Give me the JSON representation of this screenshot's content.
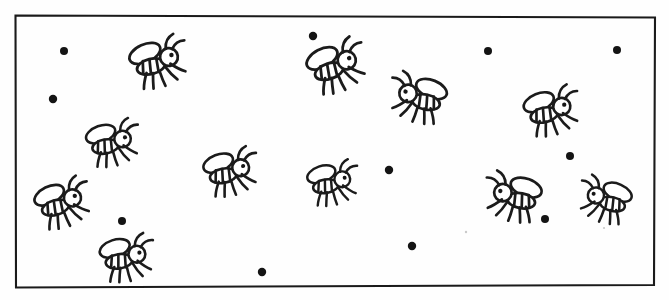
{
  "image": {
    "title": "Flies and dots inside a rectangular frame",
    "kind": "line-drawing-worksheet",
    "width": 669,
    "height": 300,
    "background_color": "#ffffff",
    "ink_color": "#1b1b1b"
  },
  "frame": {
    "name": "rectangular-border",
    "stroke_color": "#1a1a1a",
    "stroke_width": 2.1,
    "corners": {
      "top_left": [
        15,
        15
      ],
      "top_right": [
        655,
        17
      ],
      "bottom_right": [
        654,
        285
      ],
      "bottom_left": [
        16,
        287
      ]
    }
  },
  "counts": {
    "flies": 14,
    "dots": 13,
    "total_objects": 27
  },
  "flies": [
    {
      "id": "fly-1",
      "x": 160,
      "y": 62,
      "facing": "right",
      "scale": 1.06,
      "rotation": -8
    },
    {
      "id": "fly-2",
      "x": 114,
      "y": 143,
      "facing": "right",
      "scale": 0.98,
      "rotation": -4
    },
    {
      "id": "fly-3",
      "x": 64,
      "y": 203,
      "facing": "right",
      "scale": 1.02,
      "rotation": -10
    },
    {
      "id": "fly-4",
      "x": 128,
      "y": 258,
      "facing": "right",
      "scale": 1.0,
      "rotation": -2
    },
    {
      "id": "fly-5",
      "x": 232,
      "y": 172,
      "facing": "right",
      "scale": 1.0,
      "rotation": -5
    },
    {
      "id": "fly-6",
      "x": 334,
      "y": 183,
      "facing": "right",
      "scale": 0.94,
      "rotation": -3
    },
    {
      "id": "fly-7",
      "x": 338,
      "y": 66,
      "facing": "right",
      "scale": 1.08,
      "rotation": -12
    },
    {
      "id": "fly-8",
      "x": 553,
      "y": 111,
      "facing": "right",
      "scale": 1.02,
      "rotation": -6
    },
    {
      "id": "fly-9",
      "x": 417,
      "y": 98,
      "facing": "left",
      "scale": 1.04,
      "rotation": 6
    },
    {
      "id": "fly-10",
      "x": 512,
      "y": 197,
      "facing": "left",
      "scale": 1.04,
      "rotation": 4
    },
    {
      "id": "fly-11",
      "x": 604,
      "y": 200,
      "facing": "left",
      "scale": 0.96,
      "rotation": 8
    },
    {
      "id": "fly-12",
      "x": 232,
      "y": 172,
      "facing": "right",
      "scale": 1.0,
      "rotation": -5,
      "duplicate_of": "fly-5",
      "render": false
    },
    {
      "id": "fly-13",
      "x": 160,
      "y": 62,
      "facing": "right",
      "scale": 1.06,
      "rotation": -8,
      "duplicate_of": "fly-1",
      "render": false
    },
    {
      "id": "fly-14",
      "x": 128,
      "y": 258,
      "facing": "right",
      "scale": 1.0,
      "rotation": -2,
      "duplicate_of": "fly-4",
      "render": false
    }
  ],
  "dots": [
    {
      "id": "dot-1",
      "x": 64,
      "y": 51,
      "r": 4.0
    },
    {
      "id": "dot-2",
      "x": 53,
      "y": 99,
      "r": 4.2
    },
    {
      "id": "dot-3",
      "x": 313,
      "y": 36,
      "r": 4.2
    },
    {
      "id": "dot-4",
      "x": 488,
      "y": 51,
      "r": 4.0
    },
    {
      "id": "dot-5",
      "x": 617,
      "y": 50,
      "r": 4.0
    },
    {
      "id": "dot-6",
      "x": 570,
      "y": 156,
      "r": 4.0
    },
    {
      "id": "dot-7",
      "x": 389,
      "y": 170,
      "r": 4.2
    },
    {
      "id": "dot-8",
      "x": 122,
      "y": 221,
      "r": 4.0
    },
    {
      "id": "dot-9",
      "x": 545,
      "y": 219,
      "r": 4.0
    },
    {
      "id": "dot-10",
      "x": 412,
      "y": 246,
      "r": 4.2
    },
    {
      "id": "dot-11",
      "x": 262,
      "y": 272,
      "r": 4.2
    },
    {
      "id": "dot-12",
      "x": 64,
      "y": 51,
      "r": 4.0,
      "duplicate_of": "dot-1",
      "render": false
    },
    {
      "id": "dot-13",
      "x": 53,
      "y": 99,
      "r": 4.2,
      "duplicate_of": "dot-2",
      "render": false
    }
  ],
  "specks": [
    {
      "id": "speck-1",
      "x": 466,
      "y": 232,
      "r": 1.2
    },
    {
      "id": "speck-2",
      "x": 604,
      "y": 228,
      "r": 1.1
    }
  ],
  "fly_part_names": [
    "wing",
    "body",
    "head",
    "eye",
    "antenna-left",
    "antenna-right",
    "leg"
  ]
}
